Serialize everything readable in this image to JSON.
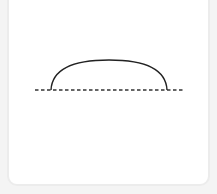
{
  "figure": {
    "shape": "circular-segment-arc",
    "baseline": {
      "x1": 35,
      "x2": 184,
      "y": 90,
      "style": "dashed",
      "color": "#333333"
    },
    "arc": {
      "x_start": 51,
      "x_end": 167,
      "base_y": 90,
      "peak_y": 60,
      "color": "#222222"
    }
  },
  "colors": {
    "background": "#f4f4f4",
    "card": "#ffffff",
    "card_border": "#ececec"
  }
}
